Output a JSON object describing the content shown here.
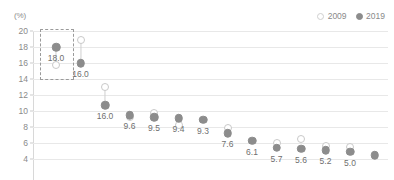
{
  "unit": "(%)",
  "legend": {
    "position": "top-right",
    "items": [
      {
        "label": "2009",
        "marker": "hollow-circle",
        "color": "#ffffff"
      },
      {
        "label": "2019",
        "marker": "filled-circle",
        "color": "#8c8c8c"
      }
    ]
  },
  "axis": {
    "yticks": [
      "20",
      "18",
      "16",
      "14",
      "12",
      "10",
      "8",
      "6",
      "4"
    ]
  },
  "chart_data": {
    "type": "scatter",
    "title": "",
    "subtitle": "",
    "xlabel": "",
    "ylabel": "",
    "unit": "(%)",
    "ylim": [
      4,
      20
    ],
    "ytick_values": [
      20,
      18,
      16,
      14,
      12,
      10,
      8,
      6,
      4
    ],
    "grid": true,
    "legend_position": "top-right",
    "categories": [
      "1",
      "2",
      "3",
      "4",
      "5",
      "6",
      "7",
      "8",
      "9",
      "10",
      "11",
      "12",
      "13",
      "14",
      "15"
    ],
    "series": [
      {
        "name": "2009",
        "marker": "hollow-circle",
        "color": "#ffffff",
        "values": [
          15.7,
          18.9,
          13.0,
          9.3,
          9.7,
          8.3,
          null,
          7.9,
          null,
          6.0,
          6.5,
          5.6,
          5.5,
          null,
          null
        ]
      },
      {
        "name": "2019",
        "marker": "filled-circle",
        "color": "#8c8c8c",
        "values": [
          18.0,
          16.0,
          10.7,
          9.5,
          9.2,
          9.1,
          8.9,
          7.2,
          6.3,
          5.4,
          5.3,
          5.1,
          4.9,
          4.5,
          4.4
        ]
      }
    ],
    "data_labels": [
      {
        "index": 0,
        "series": "2019",
        "text": "18.0"
      },
      {
        "index": 1,
        "series": "2019",
        "text": "16.0"
      },
      {
        "index": 2,
        "series": "2019",
        "text": "16.0"
      },
      {
        "index": 3,
        "series": "2019",
        "text": "9.6"
      },
      {
        "index": 4,
        "series": "2019",
        "text": "9.5"
      },
      {
        "index": 5,
        "series": "2019",
        "text": "9.4"
      },
      {
        "index": 6,
        "series": "2019",
        "text": "9.3"
      },
      {
        "index": 7,
        "series": "2019",
        "text": "7.6"
      },
      {
        "index": 8,
        "series": "2019",
        "text": "6.1"
      },
      {
        "index": 9,
        "series": "2019",
        "text": "5.7"
      },
      {
        "index": 10,
        "series": "2019",
        "text": "5.6"
      },
      {
        "index": 11,
        "series": "2019",
        "text": "5.2"
      },
      {
        "index": 12,
        "series": "2019",
        "text": "5.0"
      }
    ],
    "annotations": [
      {
        "type": "dashed-box",
        "target_index": 0,
        "note": "highlight around first category"
      }
    ]
  }
}
